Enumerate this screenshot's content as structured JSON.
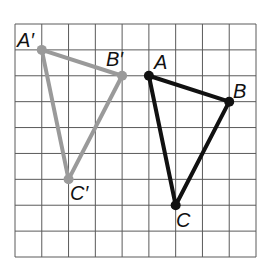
{
  "figure": {
    "grid": {
      "columns": 9,
      "rows": 9,
      "left": 15,
      "top": 24,
      "right": 256,
      "bottom": 257,
      "line_color": "#5a5a5a"
    },
    "colors": {
      "original": "#111111",
      "image": "#9a9a9a"
    },
    "triangles": [
      {
        "name": "original",
        "vertices": [
          {
            "label": "A",
            "grid": [
              5,
              2
            ]
          },
          {
            "label": "B",
            "grid": [
              8,
              3
            ]
          },
          {
            "label": "C",
            "grid": [
              6,
              7
            ]
          }
        ]
      },
      {
        "name": "image",
        "vertices": [
          {
            "label": "A'",
            "grid": [
              1,
              1
            ]
          },
          {
            "label": "B'",
            "grid": [
              4,
              2
            ]
          },
          {
            "label": "C'",
            "grid": [
              2,
              6
            ]
          }
        ]
      }
    ],
    "labels": {
      "A": "A",
      "B": "B",
      "C": "C",
      "A_prime": "A′",
      "B_prime": "B′",
      "C_prime": "C′"
    }
  }
}
